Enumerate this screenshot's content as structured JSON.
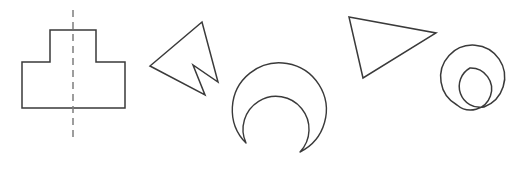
{
  "figure": {
    "background_color": "#ffffff",
    "stroke_color": "#3a3a3a",
    "axis_color": "#7d7d7d",
    "stroke_width": 1.5,
    "width": 515,
    "height": 180,
    "caption": "",
    "shape_count": 5
  },
  "shapes": [
    {
      "id": "t-shape",
      "name": "T-shaped polygon with symmetry axis",
      "type": "polygon",
      "vertex_count": 8,
      "points": "50,30 96,30 96,62 125,62 125,108 22,108 22,62 50,62",
      "has_symmetry_axis": true,
      "symmetry_axis": {
        "type": "vertical-dashed",
        "x": 73,
        "y_start": 10,
        "y_end": 137
      }
    },
    {
      "id": "arrow-shape",
      "name": "Concave arrow dart",
      "type": "polygon",
      "vertex_count": 5,
      "points": "202,22 150,66 205,95 193,65 218,82",
      "has_symmetry_axis": false
    },
    {
      "id": "crescent-shape",
      "name": "Crescent formed by two nested arcs",
      "type": "crescent",
      "path": "M 246,143 A 47,47 0 1 1 300,152 A 33,33 0 1 0 246,143 Z",
      "outer_arc": {
        "cx": 286,
        "cy": 108,
        "r": 47
      },
      "inner_arc": {
        "cx": 288,
        "cy": 120,
        "r": 33
      },
      "has_symmetry_axis": false
    },
    {
      "id": "triangle-shape",
      "name": "Scalene triangle",
      "type": "polygon",
      "vertex_count": 3,
      "points": "349,17 436,33 363,78",
      "has_symmetry_axis": false
    },
    {
      "id": "snowman-shape",
      "name": "Two tangent circles forming a snowman",
      "type": "compound-circles",
      "path": "M 470,68 A 21,21 0 1 1 457,105 A 32,32 0 1 1 484,107 A 21,21 0 0 1 470,68 Z",
      "small_circle": {
        "cx": 470,
        "cy": 89,
        "r": 21
      },
      "large_circle": {
        "cx": 466,
        "cy": 124,
        "r": 32
      },
      "has_symmetry_axis": false
    }
  ]
}
